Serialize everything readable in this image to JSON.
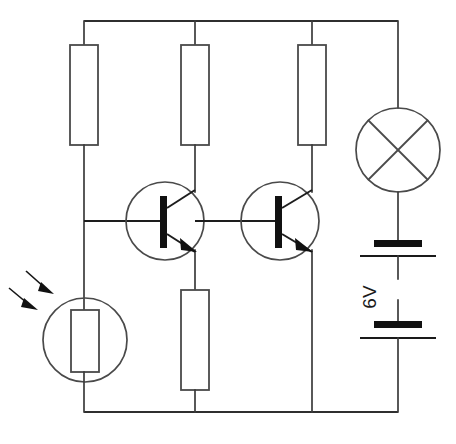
{
  "diagram": {
    "type": "electronic-schematic",
    "background_color": "#ffffff",
    "line_color": "#3b3b3b",
    "fill_color": "#111111"
  },
  "labels": {
    "battery_voltage": "6V",
    "bottom_caption": ""
  },
  "components": [
    {
      "id": "r1",
      "name": "resistor-top-left",
      "kind": "resistor",
      "x": 84,
      "y": 95,
      "w": 28,
      "h": 100
    },
    {
      "id": "r2",
      "name": "resistor-top-middle",
      "kind": "resistor",
      "x": 195,
      "y": 95,
      "w": 28,
      "h": 100
    },
    {
      "id": "r3",
      "name": "resistor-top-right",
      "kind": "resistor",
      "x": 312,
      "y": 95,
      "w": 28,
      "h": 100
    },
    {
      "id": "r4",
      "name": "resistor-bottom-middle",
      "kind": "resistor",
      "x": 195,
      "y": 340,
      "w": 28,
      "h": 100
    },
    {
      "id": "ldr",
      "name": "light-dependent-resistor",
      "kind": "ldr",
      "x": 85,
      "y": 340,
      "r": 42
    },
    {
      "id": "q1",
      "name": "transistor-npn-left",
      "kind": "npn-transistor",
      "x": 165,
      "y": 221,
      "r": 39
    },
    {
      "id": "q2",
      "name": "transistor-npn-right",
      "kind": "npn-transistor",
      "x": 280,
      "y": 221,
      "r": 39
    },
    {
      "id": "lamp",
      "name": "lamp",
      "kind": "lamp",
      "x": 398,
      "y": 150,
      "r": 42
    },
    {
      "id": "batt",
      "name": "battery",
      "kind": "battery",
      "x": 398,
      "y": 290,
      "cells": 2
    }
  ],
  "rails": {
    "top": {
      "name": "top-power-rail",
      "y": 21,
      "x1": 84,
      "x2": 398
    },
    "bottom": {
      "name": "bottom-ground-rail",
      "y": 412,
      "x1": 84,
      "x2": 398
    }
  },
  "light_arrows": {
    "name": "incident-light-arrows",
    "count": 2,
    "direction": "down-right"
  }
}
